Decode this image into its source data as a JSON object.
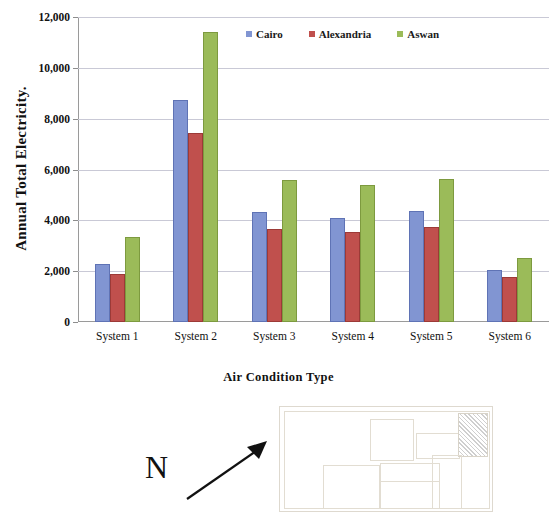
{
  "chart_data": {
    "type": "bar",
    "title": "",
    "xlabel": "Air Condition Type",
    "ylabel": "Annual Total Electricity.",
    "categories": [
      "System 1",
      "System 2",
      "System 3",
      "System 4",
      "System 5",
      "System 6"
    ],
    "series": [
      {
        "name": "Cairo",
        "color": "#8195d2",
        "values": [
          2280,
          8730,
          4330,
          4090,
          4370,
          2030
        ]
      },
      {
        "name": "Alexandria",
        "color": "#c0504d",
        "values": [
          1870,
          7450,
          3660,
          3530,
          3740,
          1760
        ]
      },
      {
        "name": "Aswan",
        "color": "#9bbb59",
        "values": [
          3340,
          11400,
          5580,
          5400,
          5630,
          2500
        ]
      }
    ],
    "ylim": [
      0,
      12000
    ],
    "ytick_values": [
      0,
      2000,
      4000,
      6000,
      8000,
      10000,
      12000
    ],
    "ytick_labels": [
      "0",
      "2,000",
      "4,000",
      "6,000",
      "8,000",
      "10,000",
      "12,000"
    ],
    "grid": true,
    "legend_position": "top-center"
  },
  "legend": {
    "items": [
      {
        "label": "Cairo",
        "swatch": "cairo"
      },
      {
        "label": "Alexandria",
        "swatch": "alex"
      },
      {
        "label": "Aswan",
        "swatch": "aswan"
      }
    ]
  },
  "north_indicator": {
    "letter": "N",
    "icon": "north-arrow-icon"
  },
  "floor_plan": {
    "label": "",
    "rooms": [
      {
        "x": 4,
        "y": 4,
        "w": 204,
        "h": 96,
        "hatched": false
      },
      {
        "x": 90,
        "y": 12,
        "w": 42,
        "h": 40,
        "hatched": false
      },
      {
        "x": 136,
        "y": 26,
        "w": 42,
        "h": 24,
        "hatched": false
      },
      {
        "x": 178,
        "y": 6,
        "w": 28,
        "h": 42,
        "hatched": true
      },
      {
        "x": 43,
        "y": 58,
        "w": 55,
        "h": 42,
        "hatched": false
      },
      {
        "x": 100,
        "y": 56,
        "w": 58,
        "h": 44,
        "hatched": false
      },
      {
        "x": 100,
        "y": 74,
        "w": 58,
        "h": 26,
        "hatched": false
      },
      {
        "x": 152,
        "y": 48,
        "w": 28,
        "h": 52,
        "hatched": false
      }
    ]
  }
}
